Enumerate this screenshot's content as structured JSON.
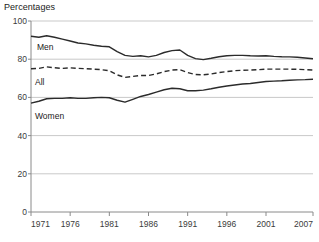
{
  "chart_data": {
    "type": "line",
    "title": "Percentages",
    "xlabel": "",
    "ylabel": "",
    "xlim": [
      1971,
      2007
    ],
    "ylim": [
      0,
      100
    ],
    "grid": true,
    "grid_axis": "y",
    "legend_position": "inline-labels",
    "x_ticks": [
      "1971",
      "1976",
      "1981",
      "1986",
      "1991",
      "1996",
      "2001",
      "2007"
    ],
    "x_tick_values": [
      1971,
      1976,
      1981,
      1986,
      1991,
      1996,
      2001,
      2007
    ],
    "y_ticks": [
      "0",
      "20",
      "40",
      "60",
      "80",
      "100"
    ],
    "y_tick_values": [
      0,
      20,
      40,
      60,
      80,
      100
    ],
    "x": [
      1971,
      1972,
      1973,
      1974,
      1975,
      1976,
      1977,
      1978,
      1979,
      1980,
      1981,
      1982,
      1983,
      1984,
      1985,
      1986,
      1987,
      1988,
      1989,
      1990,
      1991,
      1992,
      1993,
      1994,
      1995,
      1996,
      1997,
      1998,
      1999,
      2000,
      2001,
      2002,
      2003,
      2004,
      2005,
      2006,
      2007
    ],
    "series": [
      {
        "name": "Men",
        "label": "Men",
        "style": "solid",
        "color": "#2b2b2b",
        "values": [
          92.0,
          91.5,
          92.3,
          91.5,
          90.5,
          89.5,
          88.5,
          88.0,
          87.3,
          86.8,
          86.5,
          84.0,
          82.0,
          81.5,
          81.8,
          81.2,
          82.0,
          83.5,
          84.5,
          84.8,
          82.0,
          80.3,
          79.8,
          80.5,
          81.3,
          81.8,
          82.0,
          82.0,
          81.8,
          81.7,
          81.8,
          81.5,
          81.3,
          81.2,
          81.0,
          80.6,
          80.2
        ],
        "start_value": 92,
        "end_value": 80
      },
      {
        "name": "All",
        "label": "All",
        "style": "dashed",
        "color": "#2b2b2b",
        "values": [
          75.0,
          75.2,
          76.0,
          75.5,
          75.2,
          75.5,
          75.2,
          75.0,
          74.8,
          74.5,
          74.0,
          71.8,
          70.5,
          71.0,
          71.5,
          71.5,
          72.3,
          73.5,
          74.3,
          74.5,
          73.0,
          72.0,
          71.8,
          72.3,
          73.0,
          73.5,
          74.0,
          74.2,
          74.3,
          74.5,
          74.8,
          74.8,
          74.8,
          74.8,
          74.7,
          74.5,
          74.3
        ],
        "start_value": 75,
        "end_value": 74
      },
      {
        "name": "Women",
        "label": "Women",
        "style": "solid",
        "color": "#2b2b2b",
        "values": [
          57.0,
          58.0,
          59.3,
          59.5,
          59.5,
          59.8,
          59.5,
          59.5,
          59.8,
          60.0,
          59.8,
          58.5,
          57.5,
          59.0,
          60.5,
          61.5,
          62.8,
          64.0,
          64.8,
          64.5,
          63.5,
          63.5,
          63.8,
          64.5,
          65.3,
          66.0,
          66.5,
          67.0,
          67.3,
          67.8,
          68.3,
          68.5,
          68.7,
          69.0,
          69.2,
          69.3,
          69.5
        ],
        "start_value": 57,
        "end_value": 70
      }
    ]
  },
  "colors": {
    "line": "#2b2b2b",
    "grid": "#c9c9c9",
    "axis": "#8a8a8a",
    "text": "#1a1a1a"
  }
}
